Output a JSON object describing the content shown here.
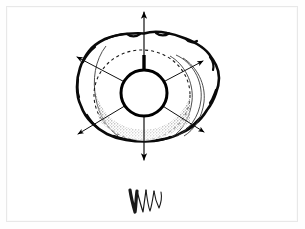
{
  "document": {
    "type": "scanned-line-drawing",
    "medium": "ink on white paper",
    "background_color": "#ffffff",
    "paper_color": "#fefefe",
    "frame_color": "#e8e8e8",
    "ink_color": "#111111",
    "accent_color": "#000000",
    "title": "",
    "caption": "",
    "labels": []
  },
  "figure": {
    "name": "radiating-arrows-over-shell-mass",
    "center": {
      "x": 144,
      "y": 93
    },
    "core_circle": {
      "name": "central-circle",
      "cx": 144,
      "cy": 93,
      "r": 23,
      "fill": "#ffffff",
      "stroke": "#000000",
      "stroke_width": 3
    },
    "dashed_ellipse": {
      "name": "dashed-orbit-ellipse",
      "cx": 142,
      "cy": 95,
      "rx": 48,
      "ry": 45,
      "stroke": "#1a1a1a",
      "dash": "3 3"
    },
    "blob_outline": {
      "name": "irregular-mass-outline",
      "stroke": "#0a0a0a",
      "stroke_width": 2.6,
      "fill": "#ffffff"
    },
    "stipple": {
      "name": "stipple-shading",
      "color": "#000000",
      "placement": "below-central-circle",
      "density": "dense-near-circle-fading-outward",
      "dot_count": 2600
    },
    "vertical_stub": {
      "name": "vertical-stub-mark",
      "x": 144,
      "y_top": 55,
      "y_bottom": 70,
      "stroke_width": 3.4,
      "color": "#000000"
    },
    "arrows": [
      {
        "name": "arrow-up",
        "label": "up",
        "from": {
          "x": 144,
          "y": 86
        },
        "to": {
          "x": 144,
          "y": 12
        }
      },
      {
        "name": "arrow-down",
        "label": "down",
        "from": {
          "x": 144,
          "y": 101
        },
        "to": {
          "x": 144,
          "y": 160
        }
      },
      {
        "name": "arrow-upper-left",
        "label": "upper-left",
        "from": {
          "x": 138,
          "y": 89
        },
        "to": {
          "x": 77,
          "y": 57
        }
      },
      {
        "name": "arrow-upper-right",
        "label": "upper-right",
        "from": {
          "x": 150,
          "y": 89
        },
        "to": {
          "x": 203,
          "y": 61
        }
      },
      {
        "name": "arrow-lower-left",
        "label": "lower-left",
        "from": {
          "x": 138,
          "y": 98
        },
        "to": {
          "x": 78,
          "y": 134
        }
      },
      {
        "name": "arrow-lower-right",
        "label": "lower-right",
        "from": {
          "x": 150,
          "y": 98
        },
        "to": {
          "x": 204,
          "y": 132
        }
      }
    ],
    "lobe": {
      "name": "right-lobe-fold",
      "stroke": "#333333",
      "stroke_width": 0.9,
      "contour_count": 3
    }
  },
  "signature": {
    "name": "handwritten-signature-mark",
    "text": "",
    "reading": "W-like monogram squiggle",
    "x": 144,
    "y": 200,
    "width": 34,
    "height": 28,
    "ink_color": "#1a1a1a"
  }
}
